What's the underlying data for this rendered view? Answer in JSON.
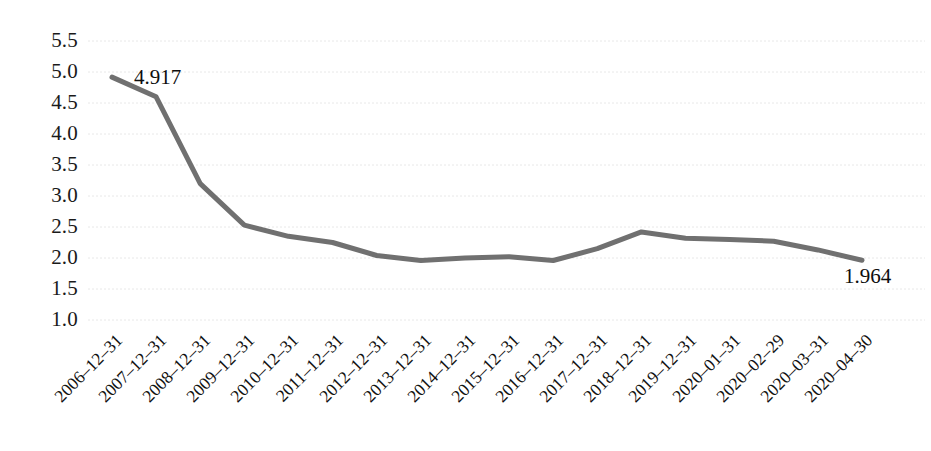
{
  "chart_data": {
    "type": "line",
    "title": "",
    "subtitle": "",
    "xlabel": "",
    "ylabel": "",
    "grid": true,
    "legend": "none",
    "ylim": [
      1.0,
      5.5
    ],
    "yticks": [
      "5.5",
      "5.0",
      "4.5",
      "4.0",
      "3.5",
      "3.0",
      "2.5",
      "2.0",
      "1.5",
      "1.0"
    ],
    "ytick_values": [
      5.5,
      5.0,
      4.5,
      4.0,
      3.5,
      3.0,
      2.5,
      2.0,
      1.5,
      1.0
    ],
    "categories": [
      "2006–12–31",
      "2007–12–31",
      "2008–12–31",
      "2009–12–31",
      "2010–12–31",
      "2011–12–31",
      "2012–12–31",
      "2013–12–31",
      "2014–12–31",
      "2015–12–31",
      "2016–12–31",
      "2017–12–31",
      "2018–12–31",
      "2019–12–31",
      "2020–01–31",
      "2020–02–29",
      "2020–03–31",
      "2020–04–30"
    ],
    "values": [
      4.917,
      4.6,
      3.2,
      2.53,
      2.35,
      2.25,
      2.04,
      1.96,
      2.0,
      2.02,
      1.96,
      2.15,
      2.42,
      2.32,
      2.3,
      2.27,
      2.13,
      1.964
    ],
    "annotations": [
      {
        "index": 0,
        "text": "4.917"
      },
      {
        "index": 17,
        "text": "1.964"
      }
    ],
    "series_color": "#707070",
    "grid_color": "#e8e8e8",
    "line_width": 5
  }
}
